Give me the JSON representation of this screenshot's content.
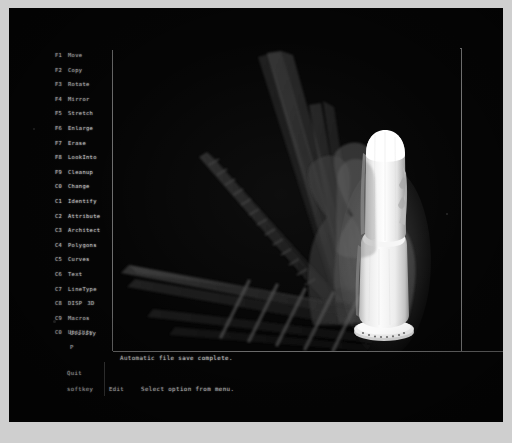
{
  "screen": {
    "background_color": "#050505",
    "phosphor_color": "#c0c0c0",
    "frame_color": "#7c7c7c"
  },
  "function_menu": {
    "title": "Function Key Menu",
    "items": [
      {
        "key": "F1",
        "label": "Move",
        "extra": ""
      },
      {
        "key": "F2",
        "label": "Copy",
        "extra": ""
      },
      {
        "key": "F3",
        "label": "Rotate",
        "extra": ""
      },
      {
        "key": "F4",
        "label": "Mirror",
        "extra": ""
      },
      {
        "key": "F5",
        "label": "Stretch",
        "extra": ""
      },
      {
        "key": "F6",
        "label": "Enlarge",
        "extra": ""
      },
      {
        "key": "F7",
        "label": "Erase",
        "extra": ""
      },
      {
        "key": "F8",
        "label": "LookInto",
        "extra": ""
      },
      {
        "key": "F9",
        "label": "Cleanup",
        "extra": ""
      },
      {
        "key": "C0",
        "label": "Change",
        "extra": ""
      },
      {
        "key": "C1",
        "label": "Identify",
        "extra": ""
      },
      {
        "key": "C2",
        "label": "Attribute",
        "extra": ""
      },
      {
        "key": "C3",
        "label": "Architect",
        "extra": ""
      },
      {
        "key": "C4",
        "label": "Polygons",
        "extra": ""
      },
      {
        "key": "C5",
        "label": "Curves",
        "extra": ""
      },
      {
        "key": "C6",
        "label": "Text",
        "extra": ""
      },
      {
        "key": "C7",
        "label": "LineType",
        "extra": ""
      },
      {
        "key": "C8",
        "label": "DISP",
        "extra": "3D"
      },
      {
        "key": "C9",
        "label": "Macros",
        "extra": ""
      },
      {
        "key": "C0",
        "label": "Utility",
        "extra": ""
      }
    ]
  },
  "status": {
    "system_label": "Utility",
    "prompt": "P",
    "quit_label": "Quit",
    "softkey_label": "softkey",
    "edit_label": "Edit",
    "message": "Automatic file save complete.",
    "hint": "Select option from menu."
  },
  "viewport": {
    "name": "graphics-viewport",
    "model_name": "3D rotated solid",
    "render_mode": "shaded",
    "highlight_color": "#f2f2f2",
    "ghost_color": "#5a5a5a"
  }
}
